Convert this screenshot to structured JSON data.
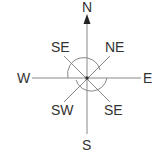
{
  "diagram": {
    "labels": {
      "n": "N",
      "s": "S",
      "e": "E",
      "w": "W",
      "upper_left": "SE",
      "upper_right": "NE",
      "lower_left": "SW",
      "lower_right": "SE"
    },
    "colors": {
      "line": "#888888",
      "text": "#333333",
      "arrow": "#222222"
    }
  }
}
